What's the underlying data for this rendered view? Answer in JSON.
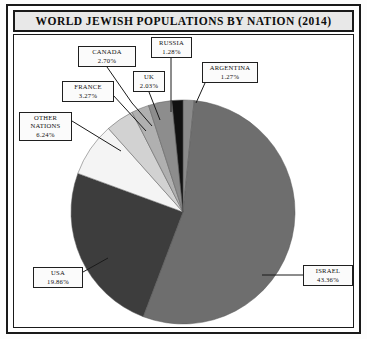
{
  "chart_frame": {
    "title": "WORLD JEWISH POPULATIONS BY NATION (2014)"
  },
  "chart_data": {
    "type": "pie",
    "title": "WORLD JEWISH POPULATIONS BY NATION (2014)",
    "xlabel": "",
    "ylabel": "",
    "legend_position": "callout-labels",
    "grid": false,
    "unit": "percent",
    "start_angle_deg": 0,
    "direction": "clockwise",
    "categories": [
      "ARGENTINA",
      "ISRAEL",
      "USA",
      "OTHER NATIONS",
      "FRANCE",
      "UK",
      "CANADA",
      "RUSSIA"
    ],
    "values": [
      1.27,
      43.36,
      19.86,
      6.24,
      3.27,
      2.03,
      2.7,
      1.28
    ],
    "slices": [
      {
        "label": "ARGENTINA",
        "value": 1.27,
        "value_text": "1.27%",
        "color": "#8a8a8a"
      },
      {
        "label": "ISRAEL",
        "value": 43.36,
        "value_text": "43.36%",
        "color": "#6e6e6e"
      },
      {
        "label": "USA",
        "value": 19.86,
        "value_text": "19.86%",
        "color": "#3d3d3d"
      },
      {
        "label": "OTHER NATIONS",
        "value": 6.24,
        "value_text": "6.24%",
        "color": "#f4f4f4"
      },
      {
        "label": "FRANCE",
        "value": 3.27,
        "value_text": "3.27%",
        "color": "#d2d2d2"
      },
      {
        "label": "UK",
        "value": 2.03,
        "value_text": "2.03%",
        "color": "#b0b0b0"
      },
      {
        "label": "CANADA",
        "value": 2.7,
        "value_text": "2.70%",
        "color": "#8d8d8d"
      },
      {
        "label": "RUSSIA",
        "value": 1.28,
        "value_text": "1.28%",
        "color": "#111111"
      }
    ]
  },
  "callouts": {
    "canada": {
      "name": "CANADA",
      "pct": "2.70%"
    },
    "russia": {
      "name": "RUSSIA",
      "pct": "1.28%"
    },
    "argentina": {
      "name": "ARGENTINA",
      "pct": "1.27%"
    },
    "uk": {
      "name": "UK",
      "pct": "2.03%"
    },
    "france": {
      "name": "FRANCE",
      "pct": "3.27%"
    },
    "other": {
      "name1": "OTHER",
      "name2": "NATIONS",
      "pct": "6.24%"
    },
    "usa": {
      "name": "USA",
      "pct": "19.86%"
    },
    "israel": {
      "name": "ISRAEL",
      "pct": "43.36%"
    }
  },
  "colors": {
    "frame": "#1a1a1a",
    "title_bg": "#e8e8e8",
    "plot_bg": "#ffffff",
    "leader_line": "#1a1a1a"
  }
}
